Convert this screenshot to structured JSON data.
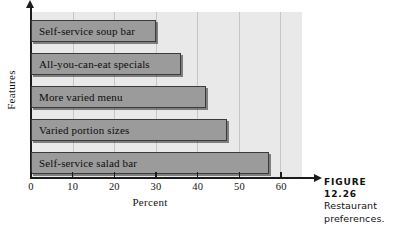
{
  "chart_data": {
    "type": "bar",
    "orientation": "horizontal",
    "title": "",
    "xlabel": "Percent",
    "ylabel": "Features",
    "categories": [
      "Self-service soup bar",
      "All-you-can-eat specials",
      "More varied menu",
      "Varied portion sizes",
      "Self-service salad bar"
    ],
    "values": [
      30,
      36,
      42,
      47,
      57
    ],
    "xlim": [
      0,
      65
    ],
    "xticks": [
      0,
      10,
      20,
      30,
      40,
      50,
      60
    ],
    "xtick_labels": [
      "0",
      "10",
      "20",
      "30",
      "40",
      "50",
      "60"
    ],
    "grid": "vertical",
    "legend": "none",
    "colors": {
      "bar_fill": "#9b9b9b",
      "bar_edge": "#3a3a3a",
      "plot_background": "#e9e9e9",
      "gridline": "#c6c6c6",
      "axis": "#1c1c1c",
      "text": "#111111"
    }
  },
  "caption": {
    "figure_label": "FIGURE 12.26",
    "lines": [
      "Restaurant",
      "preferences."
    ]
  }
}
